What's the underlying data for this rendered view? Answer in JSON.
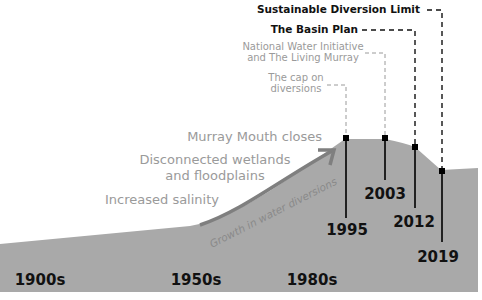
{
  "colors": {
    "area_fill": "#a9a9a9",
    "arrow": "#7f7f7f",
    "dark_text": "#111111",
    "grey_text": "#9a9a9a",
    "marker": "#000000"
  },
  "policy_labels": {
    "sdl": "Sustainable Diversion Limit",
    "basin_plan": "The Basin Plan",
    "nwi_line1": "National Water Initiative",
    "nwi_line2": "and The Living Murray",
    "cap_line1": "The cap on",
    "cap_line2": "diversions"
  },
  "impacts": {
    "murray_mouth": "Murray Mouth closes",
    "wetlands_line1": "Disconnected wetlands",
    "wetlands_line2": "and floodplains",
    "salinity": "Increased salinity"
  },
  "curve_label": "Growth in water diversions",
  "years": {
    "y1995": "1995",
    "y2003": "2003",
    "y2012": "2012",
    "y2019": "2019"
  },
  "decades": {
    "d1900": "1900s",
    "d1950": "1950s",
    "d1980": "1980s"
  }
}
